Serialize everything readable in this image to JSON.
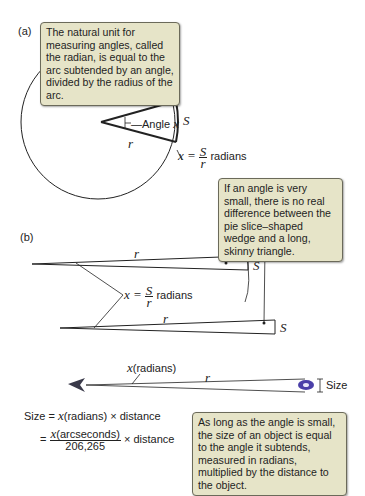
{
  "panel_a": {
    "label": "(a)",
    "callout": "The natural unit for measuring angles, called the radian, is equal to the arc subtended by an angle, divided by the radius of the arc.",
    "angle_label": "Angle",
    "angle_var": "x",
    "arc_label": "S",
    "radius_label": "r",
    "formula": {
      "lhs": "x =",
      "num": "S",
      "den": "r",
      "unit": "radians"
    }
  },
  "panel_b": {
    "label": "(b)",
    "callout": "If an angle is very small, there is no real difference between the pie slice–shaped wedge and a long, skinny triangle.",
    "top_radius_label": "r",
    "top_arc_label": "S",
    "bottom_radius_label": "r",
    "bottom_side_label": "S",
    "formula": {
      "lhs": "x =",
      "num": "S",
      "den": "r",
      "unit": "radians"
    }
  },
  "panel_c": {
    "angle_label_var": "x",
    "angle_label_unit": "(radians)",
    "radius_label": "r",
    "size_label": "Size",
    "eq1": {
      "lhs": "Size =",
      "var": "x",
      "rest": "(radians) × distance"
    },
    "eq2": {
      "eq": "=",
      "num_var": "x",
      "num_rest": "(arcseconds)",
      "den": "206,265",
      "rest": "× distance"
    },
    "callout": "As long as the angle is small, the size of an object is equal to the angle it subtends, measured in radians, multiplied by the distance to the object."
  },
  "colors": {
    "callout_bg": "#e6e4c8",
    "callout_border": "#6b6a5a",
    "line": "#222222",
    "galaxy": "#4a3fa8"
  }
}
